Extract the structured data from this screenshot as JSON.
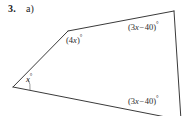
{
  "problem": {
    "number": "3.",
    "part": "a)"
  },
  "figure": {
    "shape": "quadrilateral",
    "stroke_color": "#3a3a3a",
    "background_color": "#ffffff",
    "vertices": {
      "left": [
        13,
        87
      ],
      "upper_left": [
        68,
        31
      ],
      "top_right": [
        174,
        11
      ],
      "bottom_right": [
        181,
        120
      ]
    }
  },
  "labels": {
    "angle_4x": {
      "open_paren": "(",
      "coefficient": "4",
      "variable": "x",
      "close_paren": ")",
      "degree": "°",
      "full_text": "(4x)°"
    },
    "angle_top_right": {
      "open_paren": "(",
      "coefficient": "3",
      "variable": "x",
      "operator": "−",
      "constant": "40",
      "close_paren": ")",
      "degree": "°",
      "full_text": "(3x − 40)°"
    },
    "angle_bottom_right": {
      "open_paren": "(",
      "coefficient": "3",
      "variable": "x",
      "operator": "−",
      "constant": "40",
      "close_paren": ")",
      "degree": "°",
      "full_text": "(3x − 40)°"
    },
    "angle_x": {
      "variable": "x",
      "degree": "°",
      "full_text": "x°"
    }
  }
}
